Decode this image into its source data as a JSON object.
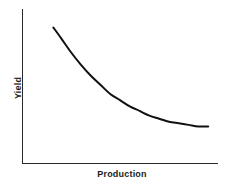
{
  "figure": {
    "background_color": "#ffffff",
    "ink_color": "#111111",
    "axis_color": "#2b2b2b",
    "width": 226,
    "height": 187
  },
  "axes": {
    "x_axis_name": "x-axis-line",
    "y_axis_name": "y-axis-line",
    "x_label": "Production",
    "y_label": "Yield",
    "show_ticks": false,
    "show_tick_labels": false,
    "show_grid": false
  },
  "chart_data": {
    "type": "line",
    "title": "",
    "subtitle": "",
    "xlabel": "Production",
    "ylabel": "Yield",
    "xlim": [
      0,
      100
    ],
    "ylim": [
      0,
      100
    ],
    "grid": false,
    "legend": false,
    "legend_position": "none",
    "tick_labels": {
      "x": [],
      "y": []
    },
    "annotations": [],
    "series": [
      {
        "name": "Yield vs Production",
        "color": "#111111",
        "line_width": 2,
        "marker": "none",
        "x": [
          16,
          20,
          25,
          30,
          35,
          40,
          45,
          50,
          55,
          60,
          65,
          70,
          75,
          80,
          85,
          90,
          95
        ],
        "y": [
          88,
          81,
          72,
          64,
          57,
          51,
          45,
          41,
          37,
          34,
          31,
          29,
          27,
          26,
          25,
          24,
          24
        ]
      }
    ]
  }
}
